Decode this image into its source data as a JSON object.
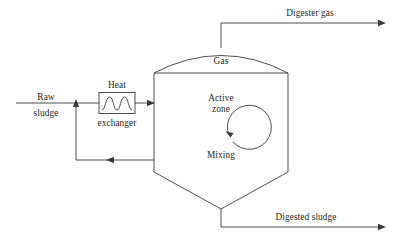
{
  "diagram": {
    "background_color": "#ffffff",
    "line_color": "#3a3a3a",
    "text_color": "#231f20",
    "labels": {
      "digester_gas": "Digester gas",
      "gas": "Gas",
      "active_zone_line1": "Active",
      "active_zone_line2": "zone",
      "mixing": "Mixing",
      "raw_line1": "Raw",
      "raw_line2": "sludge",
      "heat": "Heat",
      "exchanger": "exchanger",
      "digested_sludge": "Digested sludge"
    },
    "components": [
      {
        "name": "digester-tank",
        "label": "Digester tank"
      },
      {
        "name": "heat-exchanger",
        "label": "Heat exchanger"
      },
      {
        "name": "gas-outlet-pipe",
        "label": "Digester gas"
      },
      {
        "name": "raw-sludge-inlet",
        "label": "Raw sludge"
      },
      {
        "name": "recirculation-loop",
        "label": "Recirculation"
      },
      {
        "name": "digested-sludge-outlet",
        "label": "Digested sludge"
      },
      {
        "name": "mixing-indicator",
        "label": "Mixing"
      }
    ]
  }
}
